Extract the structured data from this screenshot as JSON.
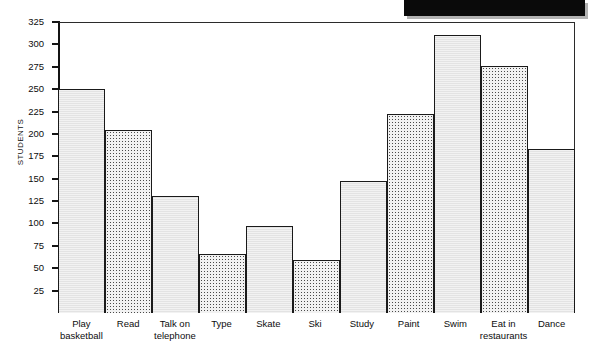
{
  "redaction": {
    "name": "redacted-black-bar",
    "color": "#0a0a0a"
  },
  "chart_data": {
    "type": "bar",
    "title": "",
    "xlabel": "",
    "ylabel": "STUDENTS",
    "ylim": [
      0,
      325
    ],
    "grid": false,
    "legend": "none",
    "y_ticks": [
      325,
      300,
      275,
      250,
      225,
      200,
      175,
      150,
      125,
      100,
      75,
      50,
      25
    ],
    "categories": [
      "Play basketball",
      "Read",
      "Talk on telephone",
      "Type",
      "Skate",
      "Ski",
      "Study",
      "Paint",
      "Swim",
      "Eat in restaurants",
      "Dance"
    ],
    "category_lines": [
      [
        "Play",
        "basketball"
      ],
      [
        "Read"
      ],
      [
        "Talk on",
        "telephone"
      ],
      [
        "Type"
      ],
      [
        "Skate"
      ],
      [
        "Ski"
      ],
      [
        "Study"
      ],
      [
        "Paint"
      ],
      [
        "Swim"
      ],
      [
        "Eat in",
        "restaurants"
      ],
      [
        "Dance"
      ]
    ],
    "values": [
      250,
      204,
      131,
      66,
      97,
      59,
      147,
      222,
      311,
      276,
      183
    ],
    "bar_fills": [
      "plain",
      "dotted",
      "plain",
      "dotted",
      "plain",
      "dotted",
      "plain",
      "dotted",
      "plain",
      "dotted",
      "plain"
    ],
    "colors": {
      "bar_plain": "#e3e3e3",
      "bar_dotted": "#f2f2f2",
      "bar_outline": "#1a1a1a",
      "axis": "#141414",
      "text": "#0d0d0d",
      "background": "#ffffff"
    }
  }
}
